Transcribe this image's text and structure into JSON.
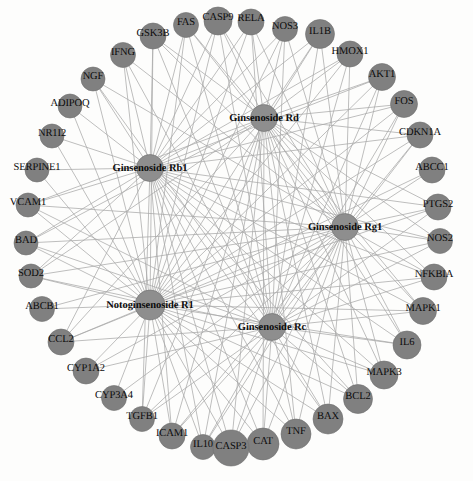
{
  "diagram": {
    "type": "circular-network",
    "background_color": "#fdfdfc",
    "node_color": "#808080",
    "hub_node_color": "#8e8e8e",
    "node_stroke_color": "#6e6e6e",
    "edge_color": "#a8a8a8",
    "label_color": "#0b0b0b",
    "width": 473,
    "height": 481
  },
  "hubs": [
    {
      "id": "rd",
      "label": "Ginsenoside Rd",
      "x": 264,
      "y": 118,
      "r": 13.5
    },
    {
      "id": "rb1",
      "label": "Ginsenoside Rb1",
      "x": 150,
      "y": 168,
      "r": 13.5
    },
    {
      "id": "rg1",
      "label": "Ginsenoside Rg1",
      "x": 345,
      "y": 227,
      "r": 13.5
    },
    {
      "id": "r1",
      "label": "Notoginsenoside R1",
      "x": 150,
      "y": 305,
      "r": 15.0
    },
    {
      "id": "rc",
      "label": "Ginsenoside Rc",
      "x": 272,
      "y": 327,
      "r": 13.5
    }
  ],
  "genes": [
    {
      "id": "CASP9",
      "label": "CASP9",
      "x": 218,
      "y": 21,
      "r": 14.0,
      "lx": 218,
      "ly": 17
    },
    {
      "id": "RELA",
      "label": "RELA",
      "x": 251,
      "y": 22,
      "r": 13.0,
      "lx": 251,
      "ly": 18
    },
    {
      "id": "FAS",
      "label": "FAS",
      "x": 186,
      "y": 25,
      "r": 12.5,
      "lx": 186,
      "ly": 22
    },
    {
      "id": "NOS3",
      "label": "NOS3",
      "x": 285,
      "y": 29,
      "r": 12.5,
      "lx": 285,
      "ly": 26
    },
    {
      "id": "GSK3B",
      "label": "GSK3B",
      "x": 153,
      "y": 36,
      "r": 13.0,
      "lx": 153,
      "ly": 33
    },
    {
      "id": "IL1B",
      "label": "IL1B",
      "x": 320,
      "y": 34,
      "r": 14.5,
      "lx": 320,
      "ly": 31
    },
    {
      "id": "IFNG",
      "label": "IFNG",
      "x": 123,
      "y": 55,
      "r": 12.5,
      "lx": 123,
      "ly": 52
    },
    {
      "id": "HMOX1",
      "label": "HMOX1",
      "x": 350,
      "y": 54,
      "r": 13.0,
      "lx": 350,
      "ly": 51
    },
    {
      "id": "NGF",
      "label": "NGF",
      "x": 93,
      "y": 79,
      "r": 12.0,
      "lx": 93,
      "ly": 76
    },
    {
      "id": "AKT1",
      "label": "AKT1",
      "x": 382,
      "y": 77,
      "r": 13.5,
      "lx": 382,
      "ly": 74
    },
    {
      "id": "ADIPOQ",
      "label": "ADIPOQ",
      "x": 70,
      "y": 106,
      "r": 12.0,
      "lx": 70,
      "ly": 103
    },
    {
      "id": "FOS",
      "label": "FOS",
      "x": 404,
      "y": 104,
      "r": 13.5,
      "lx": 404,
      "ly": 101
    },
    {
      "id": "NR1I2",
      "label": "NR1I2",
      "x": 52,
      "y": 136,
      "r": 12.0,
      "lx": 52,
      "ly": 133
    },
    {
      "id": "CDKN1A",
      "label": "CDKN1A",
      "x": 420,
      "y": 135,
      "r": 13.0,
      "lx": 420,
      "ly": 132
    },
    {
      "id": "SERPINE1",
      "label": "SERPINE1",
      "x": 37,
      "y": 170,
      "r": 12.0,
      "lx": 37,
      "ly": 167
    },
    {
      "id": "ABCC1",
      "label": "ABCC1",
      "x": 432,
      "y": 170,
      "r": 13.0,
      "lx": 432,
      "ly": 167
    },
    {
      "id": "VCAM1",
      "label": "VCAM1",
      "x": 28,
      "y": 205,
      "r": 12.0,
      "lx": 28,
      "ly": 202
    },
    {
      "id": "PTGS2",
      "label": "PTGS2",
      "x": 438,
      "y": 207,
      "r": 13.0,
      "lx": 438,
      "ly": 204
    },
    {
      "id": "BAD",
      "label": "BAD",
      "x": 26,
      "y": 243,
      "r": 12.0,
      "lx": 26,
      "ly": 240
    },
    {
      "id": "NOS2",
      "label": "NOS2",
      "x": 440,
      "y": 241,
      "r": 12.5,
      "lx": 440,
      "ly": 238
    },
    {
      "id": "SOD2",
      "label": "SOD2",
      "x": 31,
      "y": 276,
      "r": 12.0,
      "lx": 31,
      "ly": 273
    },
    {
      "id": "NFKBIA",
      "label": "NFKBIA",
      "x": 434,
      "y": 277,
      "r": 13.0,
      "lx": 434,
      "ly": 274
    },
    {
      "id": "ABCB1",
      "label": "ABCB1",
      "x": 42,
      "y": 309,
      "r": 12.5,
      "lx": 42,
      "ly": 306
    },
    {
      "id": "MAPK1",
      "label": "MAPK1",
      "x": 423,
      "y": 311,
      "r": 13.5,
      "lx": 423,
      "ly": 308
    },
    {
      "id": "CCL2",
      "label": "CCL2",
      "x": 61,
      "y": 342,
      "r": 13.0,
      "lx": 61,
      "ly": 339
    },
    {
      "id": "IL6",
      "label": "IL6",
      "x": 407,
      "y": 345,
      "r": 14.0,
      "lx": 407,
      "ly": 342
    },
    {
      "id": "CYP1A2",
      "label": "CYP1A2",
      "x": 86,
      "y": 371,
      "r": 13.0,
      "lx": 86,
      "ly": 368
    },
    {
      "id": "MAPK3",
      "label": "MAPK3",
      "x": 384,
      "y": 375,
      "r": 14.0,
      "lx": 384,
      "ly": 372
    },
    {
      "id": "CYP3A4",
      "label": "CYP3A4",
      "x": 114,
      "y": 398,
      "r": 12.5,
      "lx": 114,
      "ly": 395
    },
    {
      "id": "BCL2",
      "label": "BCL2",
      "x": 358,
      "y": 399,
      "r": 14.5,
      "lx": 358,
      "ly": 396
    },
    {
      "id": "TGFB1",
      "label": "TGFB1",
      "x": 142,
      "y": 419,
      "r": 12.5,
      "lx": 142,
      "ly": 416
    },
    {
      "id": "BAX",
      "label": "BAX",
      "x": 328,
      "y": 419,
      "r": 15.0,
      "lx": 328,
      "ly": 416
    },
    {
      "id": "ICAM1",
      "label": "ICAM1",
      "x": 172,
      "y": 436,
      "r": 13.0,
      "lx": 172,
      "ly": 433
    },
    {
      "id": "TNF",
      "label": "TNF",
      "x": 296,
      "y": 434,
      "r": 15.0,
      "lx": 296,
      "ly": 431
    },
    {
      "id": "IL10",
      "label": "IL10",
      "x": 203,
      "y": 447,
      "r": 12.5,
      "lx": 203,
      "ly": 444
    },
    {
      "id": "CAT",
      "label": "CAT",
      "x": 263,
      "y": 444,
      "r": 16.0,
      "lx": 263,
      "ly": 441
    },
    {
      "id": "CASP3",
      "label": "CASP3",
      "x": 231,
      "y": 448,
      "r": 18.0,
      "lx": 231,
      "ly": 446
    }
  ],
  "edges": [
    {
      "source": "rd",
      "target": "CASP9"
    },
    {
      "source": "rd",
      "target": "RELA"
    },
    {
      "source": "rd",
      "target": "FAS"
    },
    {
      "source": "rd",
      "target": "NOS3"
    },
    {
      "source": "rd",
      "target": "IL1B"
    },
    {
      "source": "rd",
      "target": "HMOX1"
    },
    {
      "source": "rd",
      "target": "AKT1"
    },
    {
      "source": "rd",
      "target": "FOS"
    },
    {
      "source": "rd",
      "target": "CDKN1A"
    },
    {
      "source": "rd",
      "target": "PTGS2"
    },
    {
      "source": "rd",
      "target": "NOS2"
    },
    {
      "source": "rd",
      "target": "NFKBIA"
    },
    {
      "source": "rd",
      "target": "MAPK1"
    },
    {
      "source": "rd",
      "target": "IL6"
    },
    {
      "source": "rd",
      "target": "MAPK3"
    },
    {
      "source": "rd",
      "target": "BCL2"
    },
    {
      "source": "rd",
      "target": "BAX"
    },
    {
      "source": "rd",
      "target": "TNF"
    },
    {
      "source": "rd",
      "target": "CAT"
    },
    {
      "source": "rd",
      "target": "CASP3"
    },
    {
      "source": "rd",
      "target": "IL10"
    },
    {
      "source": "rd",
      "target": "ICAM1"
    },
    {
      "source": "rd",
      "target": "TGFB1"
    },
    {
      "source": "rd",
      "target": "SOD2"
    },
    {
      "source": "rd",
      "target": "BAD"
    },
    {
      "source": "rd",
      "target": "VCAM1"
    },
    {
      "source": "rd",
      "target": "GSK3B"
    },
    {
      "source": "rd",
      "target": "CCL2"
    },
    {
      "source": "rb1",
      "target": "GSK3B"
    },
    {
      "source": "rb1",
      "target": "FAS"
    },
    {
      "source": "rb1",
      "target": "CASP9"
    },
    {
      "source": "rb1",
      "target": "RELA"
    },
    {
      "source": "rb1",
      "target": "NOS3"
    },
    {
      "source": "rb1",
      "target": "IFNG"
    },
    {
      "source": "rb1",
      "target": "NGF"
    },
    {
      "source": "rb1",
      "target": "IL1B"
    },
    {
      "source": "rb1",
      "target": "HMOX1"
    },
    {
      "source": "rb1",
      "target": "AKT1"
    },
    {
      "source": "rb1",
      "target": "FOS"
    },
    {
      "source": "rb1",
      "target": "CDKN1A"
    },
    {
      "source": "rb1",
      "target": "PTGS2"
    },
    {
      "source": "rb1",
      "target": "NOS2"
    },
    {
      "source": "rb1",
      "target": "NFKBIA"
    },
    {
      "source": "rb1",
      "target": "MAPK1"
    },
    {
      "source": "rb1",
      "target": "IL6"
    },
    {
      "source": "rb1",
      "target": "MAPK3"
    },
    {
      "source": "rb1",
      "target": "BCL2"
    },
    {
      "source": "rb1",
      "target": "BAX"
    },
    {
      "source": "rb1",
      "target": "TNF"
    },
    {
      "source": "rb1",
      "target": "CAT"
    },
    {
      "source": "rb1",
      "target": "CASP3"
    },
    {
      "source": "rb1",
      "target": "IL10"
    },
    {
      "source": "rb1",
      "target": "ICAM1"
    },
    {
      "source": "rb1",
      "target": "TGFB1"
    },
    {
      "source": "rb1",
      "target": "SERPINE1"
    },
    {
      "source": "rb1",
      "target": "NR1I2"
    },
    {
      "source": "rb1",
      "target": "ADIPOQ"
    },
    {
      "source": "rb1",
      "target": "VCAM1"
    },
    {
      "source": "rb1",
      "target": "BAD"
    },
    {
      "source": "rb1",
      "target": "SOD2"
    },
    {
      "source": "rb1",
      "target": "CCL2"
    },
    {
      "source": "rg1",
      "target": "CASP9"
    },
    {
      "source": "rg1",
      "target": "RELA"
    },
    {
      "source": "rg1",
      "target": "NOS3"
    },
    {
      "source": "rg1",
      "target": "IL1B"
    },
    {
      "source": "rg1",
      "target": "HMOX1"
    },
    {
      "source": "rg1",
      "target": "AKT1"
    },
    {
      "source": "rg1",
      "target": "FOS"
    },
    {
      "source": "rg1",
      "target": "CDKN1A"
    },
    {
      "source": "rg1",
      "target": "ABCC1"
    },
    {
      "source": "rg1",
      "target": "PTGS2"
    },
    {
      "source": "rg1",
      "target": "NOS2"
    },
    {
      "source": "rg1",
      "target": "NFKBIA"
    },
    {
      "source": "rg1",
      "target": "MAPK1"
    },
    {
      "source": "rg1",
      "target": "IL6"
    },
    {
      "source": "rg1",
      "target": "MAPK3"
    },
    {
      "source": "rg1",
      "target": "BCL2"
    },
    {
      "source": "rg1",
      "target": "BAX"
    },
    {
      "source": "rg1",
      "target": "TNF"
    },
    {
      "source": "rg1",
      "target": "CAT"
    },
    {
      "source": "rg1",
      "target": "CASP3"
    },
    {
      "source": "rg1",
      "target": "IL10"
    },
    {
      "source": "rg1",
      "target": "ICAM1"
    },
    {
      "source": "rg1",
      "target": "TGFB1"
    },
    {
      "source": "rg1",
      "target": "CYP3A4"
    },
    {
      "source": "rg1",
      "target": "CYP1A2"
    },
    {
      "source": "rg1",
      "target": "CCL2"
    },
    {
      "source": "rg1",
      "target": "ABCB1"
    },
    {
      "source": "rg1",
      "target": "SOD2"
    },
    {
      "source": "rg1",
      "target": "BAD"
    },
    {
      "source": "rg1",
      "target": "VCAM1"
    },
    {
      "source": "rg1",
      "target": "GSK3B"
    },
    {
      "source": "rg1",
      "target": "FAS"
    },
    {
      "source": "rg1",
      "target": "IFNG"
    },
    {
      "source": "rg1",
      "target": "NGF"
    },
    {
      "source": "r1",
      "target": "GSK3B"
    },
    {
      "source": "r1",
      "target": "FAS"
    },
    {
      "source": "r1",
      "target": "CASP9"
    },
    {
      "source": "r1",
      "target": "RELA"
    },
    {
      "source": "r1",
      "target": "NOS3"
    },
    {
      "source": "r1",
      "target": "IL1B"
    },
    {
      "source": "r1",
      "target": "HMOX1"
    },
    {
      "source": "r1",
      "target": "AKT1"
    },
    {
      "source": "r1",
      "target": "FOS"
    },
    {
      "source": "r1",
      "target": "CDKN1A"
    },
    {
      "source": "r1",
      "target": "ABCC1"
    },
    {
      "source": "r1",
      "target": "PTGS2"
    },
    {
      "source": "r1",
      "target": "NOS2"
    },
    {
      "source": "r1",
      "target": "NFKBIA"
    },
    {
      "source": "r1",
      "target": "MAPK1"
    },
    {
      "source": "r1",
      "target": "IL6"
    },
    {
      "source": "r1",
      "target": "MAPK3"
    },
    {
      "source": "r1",
      "target": "BCL2"
    },
    {
      "source": "r1",
      "target": "BAX"
    },
    {
      "source": "r1",
      "target": "TNF"
    },
    {
      "source": "r1",
      "target": "CAT"
    },
    {
      "source": "r1",
      "target": "CASP3"
    },
    {
      "source": "r1",
      "target": "IL10"
    },
    {
      "source": "r1",
      "target": "ICAM1"
    },
    {
      "source": "r1",
      "target": "TGFB1"
    },
    {
      "source": "r1",
      "target": "CYP3A4"
    },
    {
      "source": "r1",
      "target": "CYP1A2"
    },
    {
      "source": "r1",
      "target": "CCL2"
    },
    {
      "source": "r1",
      "target": "ABCB1"
    },
    {
      "source": "r1",
      "target": "SOD2"
    },
    {
      "source": "r1",
      "target": "BAD"
    },
    {
      "source": "r1",
      "target": "VCAM1"
    },
    {
      "source": "r1",
      "target": "SERPINE1"
    },
    {
      "source": "r1",
      "target": "NR1I2"
    },
    {
      "source": "r1",
      "target": "ADIPOQ"
    },
    {
      "source": "r1",
      "target": "NGF"
    },
    {
      "source": "r1",
      "target": "IFNG"
    },
    {
      "source": "rc",
      "target": "GSK3B"
    },
    {
      "source": "rc",
      "target": "FAS"
    },
    {
      "source": "rc",
      "target": "CASP9"
    },
    {
      "source": "rc",
      "target": "RELA"
    },
    {
      "source": "rc",
      "target": "NOS3"
    },
    {
      "source": "rc",
      "target": "IL1B"
    },
    {
      "source": "rc",
      "target": "HMOX1"
    },
    {
      "source": "rc",
      "target": "AKT1"
    },
    {
      "source": "rc",
      "target": "FOS"
    },
    {
      "source": "rc",
      "target": "CDKN1A"
    },
    {
      "source": "rc",
      "target": "PTGS2"
    },
    {
      "source": "rc",
      "target": "NOS2"
    },
    {
      "source": "rc",
      "target": "NFKBIA"
    },
    {
      "source": "rc",
      "target": "MAPK1"
    },
    {
      "source": "rc",
      "target": "IL6"
    },
    {
      "source": "rc",
      "target": "MAPK3"
    },
    {
      "source": "rc",
      "target": "BCL2"
    },
    {
      "source": "rc",
      "target": "BAX"
    },
    {
      "source": "rc",
      "target": "TNF"
    },
    {
      "source": "rc",
      "target": "CAT"
    },
    {
      "source": "rc",
      "target": "CASP3"
    },
    {
      "source": "rc",
      "target": "IL10"
    },
    {
      "source": "rc",
      "target": "ICAM1"
    },
    {
      "source": "rc",
      "target": "TGFB1"
    },
    {
      "source": "rc",
      "target": "CYP1A2"
    },
    {
      "source": "rc",
      "target": "CCL2"
    },
    {
      "source": "rc",
      "target": "SOD2"
    },
    {
      "source": "rc",
      "target": "BAD"
    },
    {
      "source": "rc",
      "target": "VCAM1"
    },
    {
      "source": "rc",
      "target": "NGF"
    },
    {
      "source": "rc",
      "target": "IFNG"
    }
  ]
}
